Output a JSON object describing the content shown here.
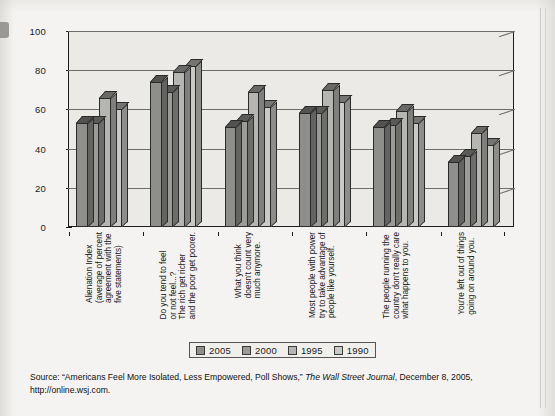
{
  "chart_data": {
    "type": "bar",
    "title": "",
    "subtitle": "",
    "xlabel": "",
    "ylabel": "",
    "ylim": [
      0,
      100
    ],
    "yticks": [
      0,
      20,
      40,
      60,
      80,
      100
    ],
    "ytick_labels": [
      "0",
      "20",
      "40",
      "60",
      "80",
      "100"
    ],
    "grid": true,
    "grid_axis": "y",
    "legend_position": "bottom-center",
    "orientation": "vertical",
    "style": "3d-clustered-columns",
    "categories": [
      "Alienation Index (average of percent agreement with the five statements)",
      "Do you tend to feel... or not feel...? The rich get richer and the poor get poorer.",
      "What you think doesn't count very much anymore.",
      "Most people with power try to take advantage of people like yourself.",
      "The people running the country don't really care what happens to you.",
      "You're left out of things going on around you."
    ],
    "category_lines": [
      [
        "Alienation Index",
        "(average of percent",
        "agreement with the",
        "five statements)"
      ],
      [
        "Do you tend to feel",
        "or not feel...?",
        "The rich get richer",
        "and the poor get poorer."
      ],
      [
        "What you think",
        "doesn't count very",
        "much anymore."
      ],
      [
        "Most people with power",
        "try to take advantage of",
        "people like yourself."
      ],
      [
        "The people running the",
        "country don't really care",
        "what happens to you."
      ],
      [
        "You're left out of things",
        "going on around you."
      ]
    ],
    "series": [
      {
        "name": "2005",
        "color": "#8e8e8b",
        "values": [
          53,
          74,
          51,
          58,
          51,
          33
        ]
      },
      {
        "name": "2000",
        "color": "#9b9b98",
        "values": [
          53,
          69,
          54,
          58,
          52,
          36
        ]
      },
      {
        "name": "1995",
        "color": "#b5b5b2",
        "values": [
          66,
          79,
          69,
          70,
          59,
          48
        ]
      },
      {
        "name": "1990",
        "color": "#c9c9c6",
        "values": [
          60,
          82,
          61,
          64,
          53,
          42
        ]
      }
    ]
  },
  "legend": {
    "items": [
      {
        "label": "2005",
        "color": "#8e8e8b"
      },
      {
        "label": "2000",
        "color": "#9b9b98"
      },
      {
        "label": "1995",
        "color": "#b5b5b2"
      },
      {
        "label": "1990",
        "color": "#c9c9c6"
      }
    ]
  },
  "source": {
    "prefix": "Source: “Americans Feel More Isolated, Less Empowered, Poll Shows,” ",
    "publication": "The Wall Street Journal",
    "suffix": ", December 8, 2005,",
    "url": "http://online.wsj.com."
  },
  "colors": {
    "page_background": "#f4f3f1",
    "plot_background": "#ebeae7",
    "axis": "#1d1d1d",
    "gridline": "#6d6c69",
    "text": "#151515"
  }
}
